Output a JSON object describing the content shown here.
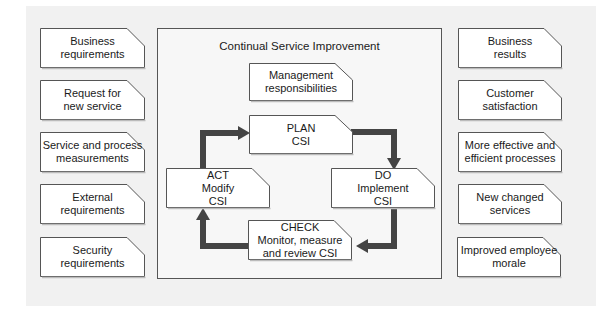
{
  "diagram": {
    "title": "Continual Service Improvement",
    "colors": {
      "background": "#f1f1f1",
      "box_fill": "#ffffff",
      "box_border": "#555555",
      "arrow": "#444444",
      "text": "#1a1a1a"
    },
    "inputs": [
      {
        "label": "Business\nrequirements"
      },
      {
        "label": "Request for\nnew service"
      },
      {
        "label": "Service and process\nmeasurements"
      },
      {
        "label": "External\nrequirements"
      },
      {
        "label": "Security\nrequirements"
      }
    ],
    "outputs": [
      {
        "label": "Business\nresults"
      },
      {
        "label": "Customer\nsatisfaction"
      },
      {
        "label": "More effective and\nefficient processes"
      },
      {
        "label": "New changed\nservices"
      },
      {
        "label": "Improved employee\nmorale"
      }
    ],
    "management": {
      "label": "Management\nresponsibilities"
    },
    "cycle": {
      "plan": {
        "label": "PLAN\nCSI"
      },
      "do": {
        "label": "DO\nImplement\nCSI"
      },
      "check": {
        "label": "CHECK\nMonitor, measure\nand review CSI"
      },
      "act": {
        "label": "ACT\nModify\nCSI"
      }
    }
  }
}
